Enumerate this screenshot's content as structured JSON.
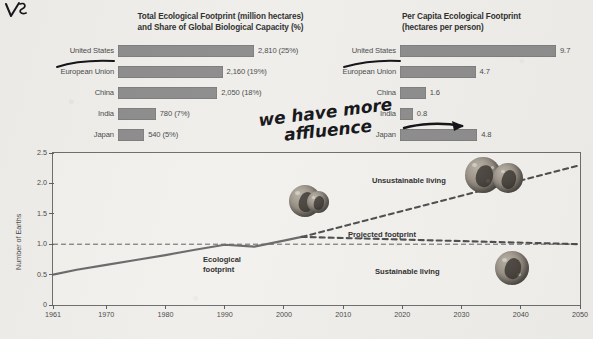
{
  "annotations": {
    "top_left_mark": "vs",
    "handwritten_note": "we have more affluence"
  },
  "total_footprint_chart": {
    "title_line1": "Total Ecological Footprint (million hectares)",
    "title_line2": "and Share of Global Biological Capacity (%)",
    "rows": [
      {
        "label": "United States",
        "value": 2810,
        "value_text": "2,810 (25%)",
        "share": 25
      },
      {
        "label": "European Union",
        "value": 2160,
        "value_text": "2,160 (19%)",
        "share": 19
      },
      {
        "label": "China",
        "value": 2050,
        "value_text": "2,050 (18%)",
        "share": 18
      },
      {
        "label": "India",
        "value": 780,
        "value_text": "780 (7%)",
        "share": 7
      },
      {
        "label": "Japan",
        "value": 540,
        "value_text": "540 (5%)",
        "share": 5
      }
    ]
  },
  "per_capita_chart": {
    "title_line1": "Per Capita Ecological Footprint",
    "title_line2": "(hectares per person)",
    "rows": [
      {
        "label": "United States",
        "value": 9.7,
        "value_text": "9.7"
      },
      {
        "label": "European Union",
        "value": 4.7,
        "value_text": "4.7"
      },
      {
        "label": "China",
        "value": 1.6,
        "value_text": "1.6"
      },
      {
        "label": "India",
        "value": 0.8,
        "value_text": "0.8"
      },
      {
        "label": "Japan",
        "value": 4.8,
        "value_text": "4.8"
      }
    ]
  },
  "chart_data": {
    "type": "line",
    "title": "",
    "xlabel": "",
    "ylabel": "Number of Earths",
    "xlim": [
      1961,
      2050
    ],
    "ylim": [
      0,
      2.5
    ],
    "grid": false,
    "xticks": [
      "1961",
      "1970",
      "1980",
      "1990",
      "2000",
      "2010",
      "2020",
      "2030",
      "2040",
      "2050"
    ],
    "yticks": [
      "0",
      "0.5",
      "1.0",
      "1.5",
      "2.0",
      "2.5"
    ],
    "reference_line": {
      "value": 1.0,
      "label": "one Earth",
      "style": "dashed"
    },
    "series": [
      {
        "name": "Ecological footprint",
        "style": "solid",
        "x": [
          1961,
          1965,
          1970,
          1975,
          1980,
          1985,
          1990,
          1995,
          2000,
          2003
        ],
        "values": [
          0.5,
          0.58,
          0.66,
          0.74,
          0.82,
          0.91,
          0.99,
          0.96,
          1.06,
          1.12
        ]
      },
      {
        "name": "Projected footprint",
        "style": "dashed",
        "x": [
          2003,
          2050
        ],
        "values": [
          1.12,
          2.3
        ]
      },
      {
        "name": "Sustainable living",
        "style": "dashed",
        "x": [
          2003,
          2050
        ],
        "values": [
          1.12,
          1.0
        ]
      }
    ],
    "annotations": [
      {
        "text": "Ecological footprint",
        "x": 1995,
        "y": 0.8
      },
      {
        "text": "Unsustainable living",
        "x": 2024,
        "y": 2.12
      },
      {
        "text": "Projected footprint",
        "x": 2012,
        "y": 1.28
      },
      {
        "text": "Sustainable living",
        "x": 2032,
        "y": 0.62
      }
    ],
    "legend_position": "in-plot"
  }
}
